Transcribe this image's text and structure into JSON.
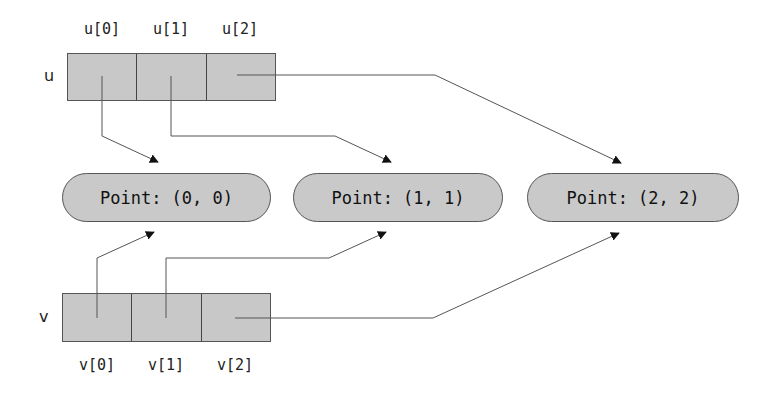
{
  "diagram": {
    "type": "array-of-references",
    "arrays": [
      {
        "name": "u",
        "indices": [
          "u[0]",
          "u[1]",
          "u[2]"
        ],
        "targets": [
          0,
          1,
          2
        ]
      },
      {
        "name": "v",
        "indices": [
          "v[0]",
          "v[1]",
          "v[2]"
        ],
        "targets": [
          0,
          1,
          2
        ]
      }
    ],
    "objects": [
      {
        "label": "Point: (0, 0)"
      },
      {
        "label": "Point: (1, 1)"
      },
      {
        "label": "Point: (2, 2)"
      }
    ],
    "colors": {
      "cell_fill": "#c8c8c8",
      "pill_fill": "#c9c9c9",
      "stroke": "#555555",
      "arrow": "#111111"
    }
  }
}
